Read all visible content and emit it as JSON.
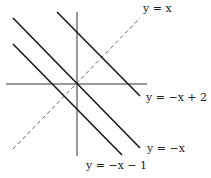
{
  "diagram": {
    "title": "",
    "axes": {
      "x_axis": {
        "x1": 6,
        "y1": 84,
        "x2": 147,
        "y2": 84
      },
      "y_axis": {
        "x1": 77,
        "y1": 12,
        "x2": 77,
        "y2": 156
      }
    },
    "lines": [
      {
        "id": "y-eq-neg-x-plus-2",
        "label": "y = −x + 2",
        "style": "solid",
        "x1": 57,
        "y1": 12,
        "x2": 140,
        "y2": 96
      },
      {
        "id": "y-eq-neg-x",
        "label": "y = −x",
        "style": "solid",
        "x1": 13,
        "y1": 18,
        "x2": 140,
        "y2": 148
      },
      {
        "id": "y-eq-neg-x-minus-1",
        "label": "y = −x − 1",
        "style": "solid",
        "x1": 13,
        "y1": 44,
        "x2": 122,
        "y2": 155
      },
      {
        "id": "y-eq-x",
        "label": "y = x",
        "style": "dashed",
        "x1": 13,
        "y1": 149,
        "x2": 140,
        "y2": 18
      }
    ],
    "labels": {
      "y_eq_x": "y = x",
      "y_eq_neg_x_plus_2": "y = −x + 2",
      "y_eq_neg_x": "y = −x",
      "y_eq_neg_x_minus_1": "y = −x − 1"
    },
    "colors": {
      "line": "#1a1a1a",
      "axis": "#333333",
      "dashed": "#555555"
    }
  }
}
